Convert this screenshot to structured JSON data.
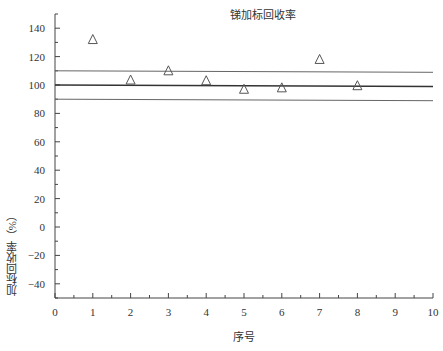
{
  "chart_data": {
    "type": "scatter",
    "title": "锑加标回收率",
    "xlabel": "序号",
    "ylabel": "加标回收率（%）",
    "xlim": [
      0,
      10
    ],
    "ylim": [
      -50,
      150
    ],
    "x_ticks": [
      0,
      1,
      2,
      3,
      4,
      5,
      6,
      7,
      8,
      9,
      10
    ],
    "y_ticks": [
      -40,
      -20,
      0,
      20,
      40,
      60,
      80,
      100,
      120,
      140
    ],
    "grid": false,
    "legend": null,
    "series": [
      {
        "name": "回收率",
        "marker": "open-triangle",
        "x": [
          1,
          2,
          3,
          4,
          5,
          6,
          7,
          8
        ],
        "y": [
          132,
          103.5,
          110,
          103,
          97,
          98,
          118,
          99.5
        ]
      }
    ],
    "reference_lines": [
      {
        "name": "upper-limit",
        "y": 110
      },
      {
        "name": "target",
        "y": 100
      },
      {
        "name": "lower-limit",
        "y": 90
      }
    ]
  }
}
